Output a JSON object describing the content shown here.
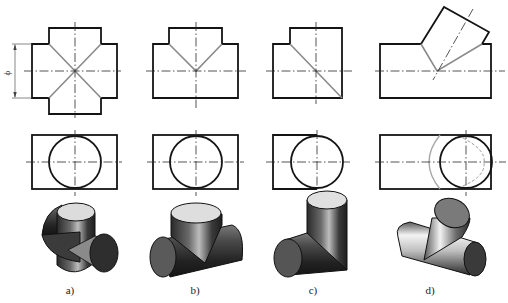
{
  "figure": {
    "dimension_label": "ϕ",
    "panels": [
      {
        "id": "a",
        "label": "a)",
        "type": "cross-joint"
      },
      {
        "id": "b",
        "label": "b)",
        "type": "tee-joint"
      },
      {
        "id": "c",
        "label": "c)",
        "type": "elbow-joint"
      },
      {
        "id": "d",
        "label": "d)",
        "type": "oblique-branch-joint"
      }
    ]
  },
  "colors": {
    "outline": "#141414",
    "intersection": "#8a8a8a",
    "shade_dark": "#2b2b2b",
    "shade_light": "#d9d9d9"
  }
}
